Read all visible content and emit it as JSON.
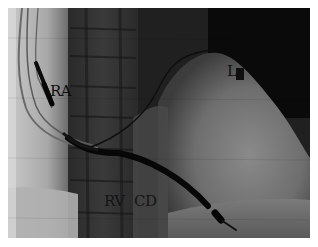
{
  "image": {
    "kind": "fluoroscopy-xray",
    "background_color": "#1e1e1e",
    "border_color": "#ffffff"
  },
  "labels": {
    "ra": "RA",
    "l": "L",
    "rv": "RV",
    "cd": "CD"
  }
}
